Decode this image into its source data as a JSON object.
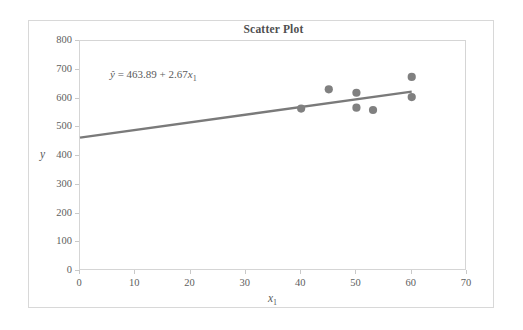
{
  "chart_data": {
    "type": "scatter",
    "title": "Scatter Plot",
    "xlabel": "x₁",
    "ylabel": "y",
    "xlim": [
      0,
      70
    ],
    "ylim": [
      0,
      800
    ],
    "xticks": [
      0,
      10,
      20,
      30,
      40,
      50,
      60,
      70
    ],
    "yticks": [
      0,
      100,
      200,
      300,
      400,
      500,
      600,
      700,
      800
    ],
    "grid": false,
    "legend": null,
    "x": [
      40,
      45,
      50,
      50,
      53,
      60,
      60
    ],
    "y": [
      565,
      632,
      620,
      568,
      560,
      675,
      605
    ],
    "points": [
      {
        "x": 40,
        "y": 565
      },
      {
        "x": 45,
        "y": 632
      },
      {
        "x": 50,
        "y": 620
      },
      {
        "x": 50,
        "y": 568
      },
      {
        "x": 53,
        "y": 560
      },
      {
        "x": 60,
        "y": 675
      },
      {
        "x": 60,
        "y": 605
      }
    ],
    "trendline": {
      "intercept": 463.89,
      "slope": 2.67,
      "x_start": 0,
      "x_end": 60,
      "y_start": 463.89,
      "y_end": 624.09
    },
    "annotations": [
      {
        "text": "ŷ = 463.89 + 2.67x₁",
        "equation_yhat": "ŷ",
        "equation_equals": "=",
        "equation_intercept": "463.89",
        "equation_plus": "+",
        "equation_slope": "2.67",
        "equation_xvar": "x",
        "equation_xsub": "1",
        "x": 8,
        "y": 660
      }
    ],
    "colors": {
      "marker": "#808080",
      "trendline": "#7a7a7a",
      "axis": "#d5d5d5",
      "text": "#5a5a5a",
      "frame": "#d8d8d8",
      "background": "#ffffff"
    }
  },
  "figure": {
    "title": "Scatter Plot",
    "x_axis_label_var": "x",
    "x_axis_label_sub": "1",
    "y_axis_label": "y",
    "y_tick_labels": [
      "800",
      "700",
      "600",
      "500",
      "400",
      "300",
      "200",
      "100",
      "0"
    ],
    "x_tick_labels": [
      "0",
      "10",
      "20",
      "30",
      "40",
      "50",
      "60",
      "70"
    ]
  }
}
